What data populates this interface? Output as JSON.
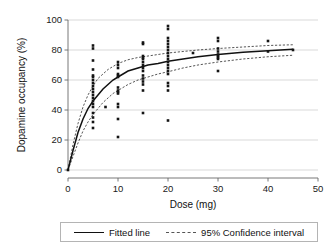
{
  "chart_data": {
    "type": "scatter",
    "title": "",
    "xlabel": "Dose (mg)",
    "ylabel": "Dopamine occupancy (%)",
    "xlim": [
      0,
      50
    ],
    "ylim": [
      0,
      100
    ],
    "xticks": [
      0,
      10,
      20,
      30,
      40,
      50
    ],
    "yticks": [
      0,
      20,
      40,
      60,
      80,
      100
    ],
    "grid": "horizontal",
    "legend_position": "below-plot",
    "legend": [
      {
        "label": "Fitted line",
        "style": "solid"
      },
      {
        "label": "95% Confidence interval",
        "style": "dashed"
      }
    ],
    "series": [
      {
        "name": "Observations",
        "type": "scatter",
        "marker": "square",
        "points": [
          [
            0,
            0
          ],
          [
            5,
            83
          ],
          [
            5,
            81
          ],
          [
            5,
            73
          ],
          [
            5,
            67
          ],
          [
            5,
            63
          ],
          [
            5,
            62
          ],
          [
            5,
            60
          ],
          [
            5,
            58
          ],
          [
            5,
            56
          ],
          [
            5,
            54
          ],
          [
            5,
            52
          ],
          [
            5,
            50
          ],
          [
            5,
            48
          ],
          [
            5,
            46
          ],
          [
            5,
            44
          ],
          [
            5,
            42
          ],
          [
            5,
            38
          ],
          [
            5,
            35
          ],
          [
            5,
            32
          ],
          [
            5,
            28
          ],
          [
            7.5,
            42
          ],
          [
            10,
            72
          ],
          [
            10,
            70
          ],
          [
            10,
            68
          ],
          [
            10,
            64
          ],
          [
            10,
            63
          ],
          [
            10,
            62
          ],
          [
            10,
            55
          ],
          [
            10,
            53
          ],
          [
            10,
            52
          ],
          [
            10,
            51
          ],
          [
            10,
            44
          ],
          [
            10,
            42
          ],
          [
            10,
            34
          ],
          [
            10,
            22
          ],
          [
            15,
            85
          ],
          [
            15,
            84
          ],
          [
            15,
            76
          ],
          [
            15,
            75
          ],
          [
            15,
            74
          ],
          [
            15,
            72
          ],
          [
            15,
            70
          ],
          [
            15,
            68
          ],
          [
            15,
            66
          ],
          [
            15,
            63
          ],
          [
            15,
            61
          ],
          [
            15,
            59
          ],
          [
            15,
            57
          ],
          [
            15,
            53
          ],
          [
            15,
            38
          ],
          [
            20,
            96
          ],
          [
            20,
            94
          ],
          [
            20,
            88
          ],
          [
            20,
            86
          ],
          [
            20,
            84
          ],
          [
            20,
            82
          ],
          [
            20,
            80
          ],
          [
            20,
            78
          ],
          [
            20,
            76
          ],
          [
            20,
            74
          ],
          [
            20,
            72
          ],
          [
            20,
            70
          ],
          [
            20,
            68
          ],
          [
            20,
            66
          ],
          [
            20,
            64
          ],
          [
            20,
            58
          ],
          [
            20,
            56
          ],
          [
            20,
            53
          ],
          [
            20,
            33
          ],
          [
            25,
            78
          ],
          [
            30,
            88
          ],
          [
            30,
            86
          ],
          [
            30,
            81
          ],
          [
            30,
            79
          ],
          [
            30,
            77
          ],
          [
            30,
            76
          ],
          [
            30,
            75
          ],
          [
            30,
            74
          ],
          [
            30,
            66
          ],
          [
            40,
            86
          ],
          [
            40,
            79
          ],
          [
            45,
            80
          ]
        ]
      },
      {
        "name": "Fitted line",
        "type": "line",
        "style": "solid",
        "points": [
          [
            0,
            0
          ],
          [
            1,
            13
          ],
          [
            2,
            25
          ],
          [
            3,
            34
          ],
          [
            4,
            41
          ],
          [
            5,
            46
          ],
          [
            6,
            50
          ],
          [
            7,
            54
          ],
          [
            8,
            57
          ],
          [
            9,
            60
          ],
          [
            10,
            62
          ],
          [
            12,
            66
          ],
          [
            14,
            68
          ],
          [
            16,
            70
          ],
          [
            18,
            71
          ],
          [
            20,
            72.5
          ],
          [
            23,
            74
          ],
          [
            26,
            75.5
          ],
          [
            30,
            77
          ],
          [
            35,
            78.5
          ],
          [
            40,
            79.5
          ],
          [
            45,
            80.5
          ]
        ]
      },
      {
        "name": "95% Confidence interval upper",
        "type": "line",
        "style": "dashed",
        "points": [
          [
            0,
            0
          ],
          [
            1,
            17
          ],
          [
            2,
            31
          ],
          [
            3,
            42
          ],
          [
            4,
            50
          ],
          [
            5,
            56
          ],
          [
            6,
            61
          ],
          [
            7,
            64
          ],
          [
            8,
            67
          ],
          [
            9,
            69
          ],
          [
            10,
            71
          ],
          [
            12,
            73.5
          ],
          [
            14,
            75
          ],
          [
            16,
            76
          ],
          [
            18,
            77
          ],
          [
            20,
            78
          ],
          [
            23,
            79
          ],
          [
            26,
            80
          ],
          [
            30,
            81
          ],
          [
            35,
            82
          ],
          [
            40,
            83
          ],
          [
            45,
            83.5
          ]
        ]
      },
      {
        "name": "95% Confidence interval lower",
        "type": "line",
        "style": "dashed",
        "points": [
          [
            0,
            0
          ],
          [
            1,
            9
          ],
          [
            2,
            18
          ],
          [
            3,
            26
          ],
          [
            4,
            32
          ],
          [
            5,
            37
          ],
          [
            6,
            41
          ],
          [
            7,
            45
          ],
          [
            8,
            48
          ],
          [
            9,
            51
          ],
          [
            10,
            53
          ],
          [
            12,
            57
          ],
          [
            14,
            60
          ],
          [
            16,
            62
          ],
          [
            18,
            64
          ],
          [
            20,
            65.5
          ],
          [
            23,
            68
          ],
          [
            26,
            70
          ],
          [
            30,
            72
          ],
          [
            35,
            74
          ],
          [
            40,
            75.5
          ],
          [
            45,
            76.5
          ]
        ]
      }
    ]
  },
  "axes": {
    "y_title": "Dopamine occupancy (%)",
    "x_title": "Dose (mg)"
  }
}
